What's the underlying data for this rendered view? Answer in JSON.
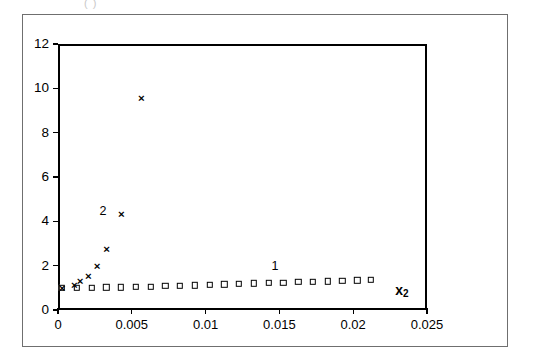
{
  "figure": {
    "caption_fragment": "( )"
  },
  "chart_data": {
    "type": "scatter",
    "title": "",
    "subtitle": "",
    "xlabel": "x2",
    "xlabel_display": "x",
    "xlabel_subscript": "2",
    "ylabel": "",
    "xlim": [
      0,
      0.025
    ],
    "ylim": [
      0,
      12
    ],
    "xticks": [
      0,
      0.005,
      0.01,
      0.015,
      0.02,
      0.025
    ],
    "xticklabels": [
      "0",
      "0.005",
      "0.01",
      "0.015",
      "0.02",
      "0.025"
    ],
    "yticks": [
      0,
      2,
      4,
      6,
      8,
      10,
      12
    ],
    "yticklabels": [
      "0",
      "2",
      "4",
      "6",
      "8",
      "10",
      "12"
    ],
    "grid": false,
    "legend": "inline-annotations",
    "annotations": [
      {
        "text": "1",
        "x": 0.0147,
        "y": 2.0
      },
      {
        "text": "2",
        "x": 0.00305,
        "y": 4.45
      }
    ],
    "series": [
      {
        "name": "1",
        "marker": "square",
        "label_text": "1",
        "points": [
          {
            "x": 0.00027,
            "y": 1.0
          },
          {
            "x": 0.00127,
            "y": 1.0
          },
          {
            "x": 0.00227,
            "y": 1.0
          },
          {
            "x": 0.00327,
            "y": 1.02
          },
          {
            "x": 0.00427,
            "y": 1.03
          },
          {
            "x": 0.00527,
            "y": 1.05
          },
          {
            "x": 0.00627,
            "y": 1.06
          },
          {
            "x": 0.00727,
            "y": 1.08
          },
          {
            "x": 0.00827,
            "y": 1.1
          },
          {
            "x": 0.00927,
            "y": 1.12
          },
          {
            "x": 0.01027,
            "y": 1.14
          },
          {
            "x": 0.01127,
            "y": 1.16
          },
          {
            "x": 0.01227,
            "y": 1.18
          },
          {
            "x": 0.01327,
            "y": 1.2
          },
          {
            "x": 0.01427,
            "y": 1.22
          },
          {
            "x": 0.01527,
            "y": 1.24
          },
          {
            "x": 0.01627,
            "y": 1.26
          },
          {
            "x": 0.01727,
            "y": 1.28
          },
          {
            "x": 0.01827,
            "y": 1.3
          },
          {
            "x": 0.01927,
            "y": 1.32
          },
          {
            "x": 0.02027,
            "y": 1.34
          },
          {
            "x": 0.0212,
            "y": 1.35
          }
        ]
      },
      {
        "name": "2",
        "marker": "cross",
        "label_text": "2",
        "glyph": "×",
        "points": [
          {
            "x": 0.00027,
            "y": 1.0
          },
          {
            "x": 0.0011,
            "y": 1.12
          },
          {
            "x": 0.0015,
            "y": 1.3
          },
          {
            "x": 0.00205,
            "y": 1.55
          },
          {
            "x": 0.00265,
            "y": 2.0
          },
          {
            "x": 0.0033,
            "y": 2.75
          },
          {
            "x": 0.0043,
            "y": 4.35
          },
          {
            "x": 0.00565,
            "y": 9.55
          }
        ]
      }
    ]
  }
}
